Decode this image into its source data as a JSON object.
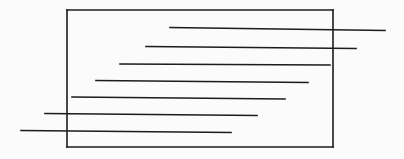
{
  "figure": {
    "name": "line-drawing-rectangle-with-horizontal-strokes",
    "canvas": {
      "width": 404,
      "height": 159,
      "background_color": "#fbfbfb"
    },
    "stroke_color": "#1c1c1c",
    "stroke_width": 1.6,
    "rectangle": {
      "label": "outer-rectangle",
      "x1": 67,
      "y1": 10,
      "x2": 333,
      "y2": 147
    },
    "lines": [
      {
        "label": "stroke-1",
        "x1": 170,
        "y1": 27.5,
        "x2": 385,
        "y2": 30.5,
        "overshoot": "right"
      },
      {
        "label": "stroke-2",
        "x1": 146,
        "y1": 46.5,
        "x2": 356,
        "y2": 48.5,
        "overshoot": "right"
      },
      {
        "label": "stroke-3",
        "x1": 120,
        "y1": 64.0,
        "x2": 330,
        "y2": 65.0,
        "overshoot": "none"
      },
      {
        "label": "stroke-4",
        "x1": 96,
        "y1": 80.5,
        "x2": 308,
        "y2": 82.5,
        "overshoot": "none"
      },
      {
        "label": "stroke-5",
        "x1": 72,
        "y1": 97.0,
        "x2": 285,
        "y2": 99.0,
        "overshoot": "none"
      },
      {
        "label": "stroke-6",
        "x1": 45,
        "y1": 113.5,
        "x2": 257,
        "y2": 115.5,
        "overshoot": "left"
      },
      {
        "label": "stroke-7",
        "x1": 21,
        "y1": 130.5,
        "x2": 231,
        "y2": 132.5,
        "overshoot": "left"
      }
    ]
  }
}
